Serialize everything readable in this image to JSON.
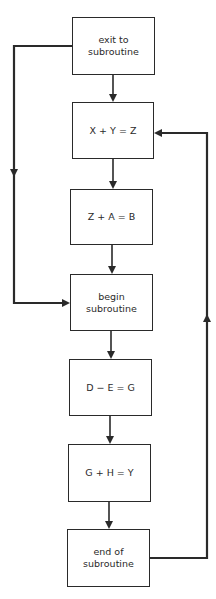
{
  "diagram": {
    "type": "flowchart",
    "colors": {
      "stroke": "#2a2a2a",
      "background": "#ffffff"
    },
    "boxes": [
      {
        "id": "exit",
        "label": "exit to\nsubroutine"
      },
      {
        "id": "xyz",
        "label": "X + Y = Z"
      },
      {
        "id": "zab",
        "label": "Z + A = B"
      },
      {
        "id": "begin",
        "label": "begin\nsubroutine"
      },
      {
        "id": "deg",
        "label": "D − E = G"
      },
      {
        "id": "ghy",
        "label": "G + H = Y"
      },
      {
        "id": "end",
        "label": "end of\nsubroutine"
      }
    ],
    "edges": [
      {
        "from": "exit",
        "to": "xyz"
      },
      {
        "from": "xyz",
        "to": "zab"
      },
      {
        "from": "zab",
        "to": "begin"
      },
      {
        "from": "begin",
        "to": "deg"
      },
      {
        "from": "deg",
        "to": "ghy"
      },
      {
        "from": "ghy",
        "to": "end"
      },
      {
        "from": "exit",
        "to": "begin",
        "route": "left"
      },
      {
        "from": "end",
        "to": "xyz",
        "route": "right"
      }
    ]
  }
}
